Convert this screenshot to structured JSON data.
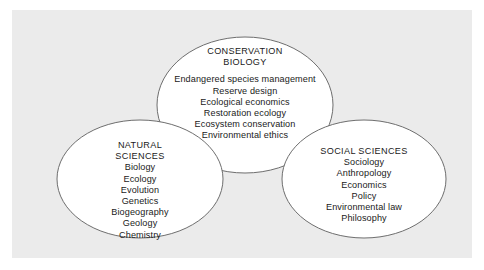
{
  "diagram": {
    "type": "venn-three-circle",
    "background_color": "#ebebeb",
    "page_color": "#ffffff",
    "ellipse_fill": "#ffffff",
    "ellipse_stroke": "#6e6e6e",
    "text_color": "#1a1a1a",
    "groups": [
      {
        "id": "conservation-biology",
        "position": "top-center",
        "title_lines": [
          "CONSERVATION",
          "BIOLOGY"
        ],
        "items": [
          "Endangered species management",
          "Reserve design",
          "Ecological economics",
          "Restoration ecology",
          "Ecosystem conservation",
          "Environmental ethics"
        ]
      },
      {
        "id": "natural-sciences",
        "position": "bottom-left",
        "title_lines": [
          "NATURAL",
          "SCIENCES"
        ],
        "items": [
          "Biology",
          "Ecology",
          "Evolution",
          "Genetics",
          "Biogeography",
          "Geology",
          "Chemistry"
        ]
      },
      {
        "id": "social-sciences",
        "position": "bottom-right",
        "title_lines": [
          "SOCIAL SCIENCES"
        ],
        "items": [
          "Sociology",
          "Anthropology",
          "Economics",
          "Policy",
          "Environmental law",
          "Philosophy"
        ]
      }
    ]
  }
}
